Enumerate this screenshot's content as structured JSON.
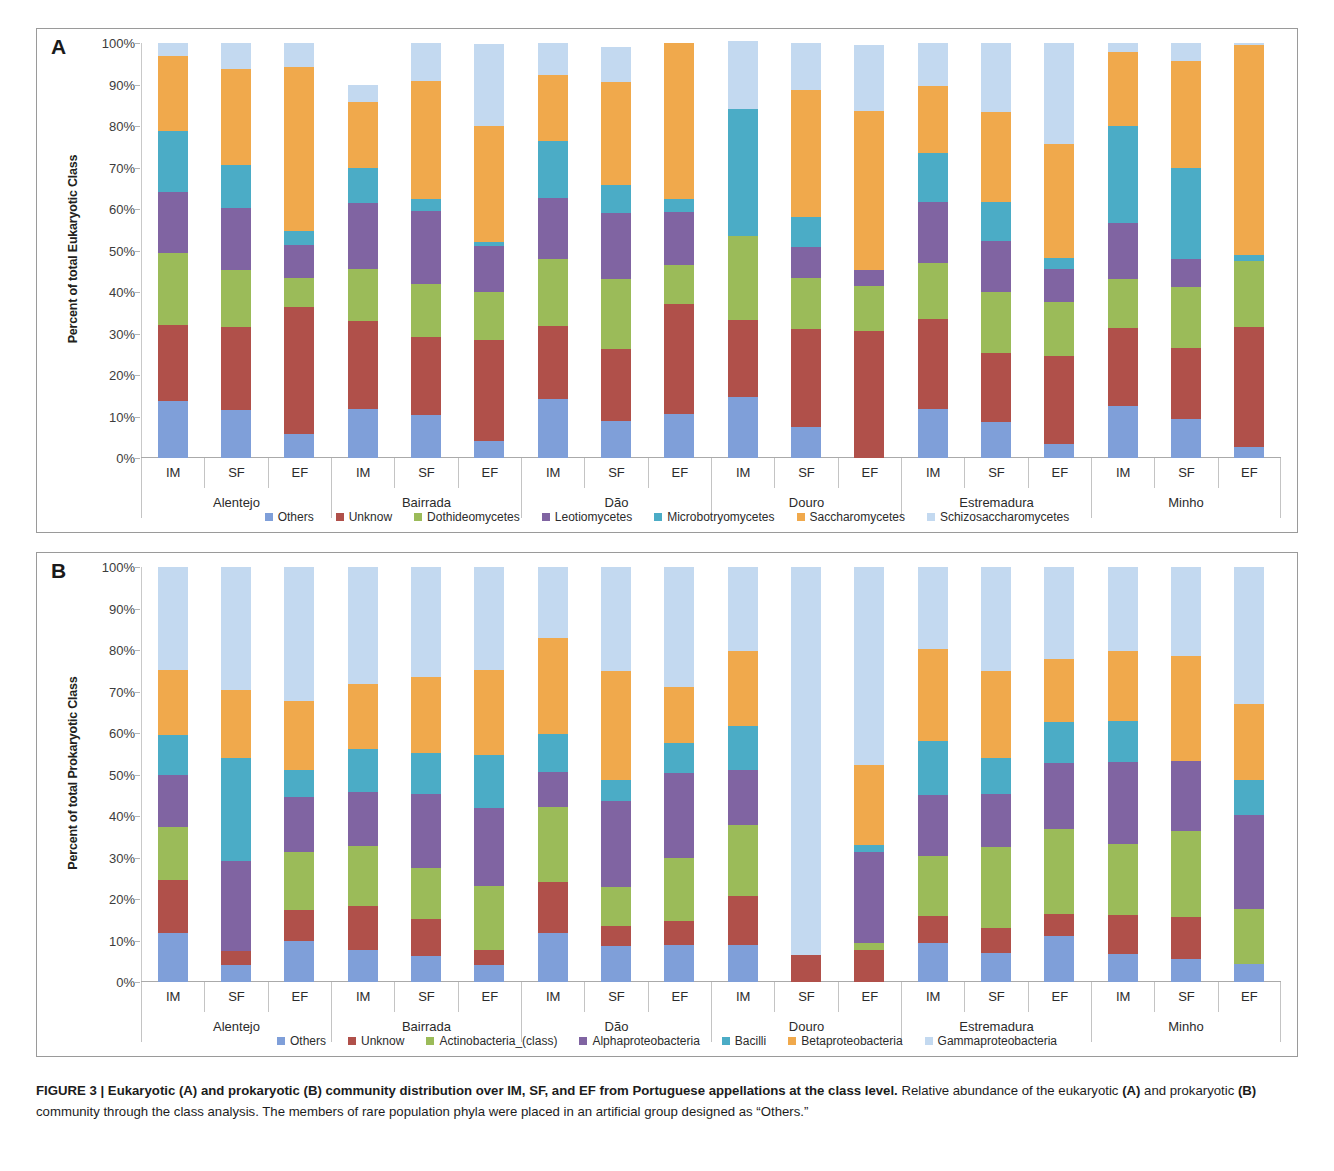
{
  "figure": {
    "caption_bold": "FIGURE 3 | Eukaryotic (A) and prokaryotic (B) community distribution over IM, SF, and EF from Portuguese appellations at the class level.",
    "caption_rest_1": " Relative abundance of the eukaryotic ",
    "caption_b_a": "(A)",
    "caption_rest_2": " and prokaryotic ",
    "caption_b_b": "(B)",
    "caption_rest_3": " community through the class analysis. The members of rare population phyla were placed in an artificial group designed as “Others.”"
  },
  "panel_a": {
    "letter": "A",
    "ylabel": "Percent of total Eukaryotic Class",
    "ytick_labels": [
      "0%",
      "10%",
      "20%",
      "30%",
      "40%",
      "50%",
      "60%",
      "70%",
      "80%",
      "90%",
      "100%"
    ]
  },
  "panel_b": {
    "letter": "B",
    "ylabel": "Percent of total Prokaryotic Class",
    "ytick_labels": [
      "0%",
      "10%",
      "20%",
      "30%",
      "40%",
      "50%",
      "60%",
      "70%",
      "80%",
      "90%",
      "100%"
    ]
  },
  "samples": [
    "IM",
    "SF",
    "EF"
  ],
  "regions": [
    "Alentejo",
    "Bairrada",
    "Dão",
    "Douro",
    "Estremadura",
    "Minho"
  ],
  "colors": {
    "others": "#7f9fd9",
    "unknow": "#b0504a",
    "green": "#9bbb59",
    "purple": "#8064a2",
    "teal": "#4bacc6",
    "orange": "#f0a94c",
    "pale_blue": "#c3d9f0"
  },
  "chart_data": [
    {
      "type": "bar",
      "id": "panel-a",
      "title": "Eukaryotic community distribution at the class level",
      "stacked": true,
      "xlabel": "",
      "ylabel": "Percent of total Eukaryotic Class",
      "ylim": [
        0,
        100
      ],
      "ytick_labels": [
        "0%",
        "10%",
        "20%",
        "30%",
        "40%",
        "50%",
        "60%",
        "70%",
        "80%",
        "90%",
        "100%"
      ],
      "grid": false,
      "legend_position": "bottom",
      "legend": [
        "Others",
        "Unknow",
        "Dothideomycetes",
        "Leotiomycetes",
        "Microbotryomycetes",
        "Saccharomycetes",
        "Schizosaccharomycetes"
      ],
      "categories": [
        "Alentejo IM",
        "Alentejo SF",
        "Alentejo EF",
        "Bairrada IM",
        "Bairrada SF",
        "Bairrada EF",
        "Dão IM",
        "Dão SF",
        "Dão EF",
        "Douro IM",
        "Douro SF",
        "Douro EF",
        "Estremadura IM",
        "Estremadura SF",
        "Estremadura EF",
        "Minho IM",
        "Minho SF",
        "Minho EF"
      ],
      "series": [
        {
          "name": "Others",
          "color": "#7f9fd9",
          "values": [
            13.8,
            11.5,
            5.8,
            11.8,
            10.3,
            4.2,
            14.3,
            8.8,
            10.5,
            14.7,
            7.5,
            0.0,
            11.9,
            8.7,
            3.3,
            12.5,
            9.3,
            2.7
          ]
        },
        {
          "name": "Unknow",
          "color": "#b0504a",
          "values": [
            18.2,
            20.0,
            30.5,
            21.2,
            18.9,
            24.3,
            17.4,
            17.5,
            26.6,
            18.5,
            23.6,
            30.5,
            21.5,
            16.7,
            21.2,
            18.8,
            17.2,
            28.8
          ]
        },
        {
          "name": "Dothideomycetes",
          "color": "#9bbb59",
          "values": [
            17.5,
            13.8,
            7.1,
            12.5,
            12.7,
            11.5,
            16.3,
            16.9,
            9.5,
            20.2,
            12.2,
            10.9,
            13.6,
            14.6,
            13.2,
            11.9,
            14.7,
            16.0
          ]
        },
        {
          "name": "Leotiomycetes",
          "color": "#8064a2",
          "values": [
            14.6,
            15.0,
            8.0,
            15.9,
            17.6,
            11.0,
            14.6,
            15.8,
            12.7,
            0.0,
            7.5,
            3.8,
            14.6,
            12.3,
            7.8,
            13.4,
            6.7,
            0.0
          ]
        },
        {
          "name": "Microbotryomycetes",
          "color": "#4bacc6",
          "values": [
            14.6,
            10.2,
            3.2,
            8.5,
            2.9,
            1.0,
            13.7,
            6.9,
            3.1,
            30.6,
            7.3,
            0.0,
            12.0,
            9.4,
            2.6,
            23.5,
            21.9,
            1.3
          ]
        },
        {
          "name": "Saccharomycetes",
          "color": "#f0a94c",
          "values": [
            18.2,
            23.3,
            39.6,
            15.9,
            28.4,
            28.0,
            15.9,
            24.6,
            37.6,
            0.0,
            30.5,
            38.5,
            16.1,
            21.6,
            27.5,
            17.8,
            25.8,
            50.7
          ]
        },
        {
          "name": "Schizosaccharomycetes",
          "color": "#c3d9f0",
          "values": [
            3.1,
            6.2,
            5.8,
            4.2,
            9.2,
            19.8,
            7.8,
            8.6,
            0.0,
            16.5,
            11.4,
            15.8,
            10.3,
            16.7,
            24.4,
            2.1,
            4.4,
            0.5
          ]
        }
      ]
    },
    {
      "type": "bar",
      "id": "panel-b",
      "title": "Prokaryotic community distribution at the class level",
      "stacked": true,
      "xlabel": "",
      "ylabel": "Percent of total Prokaryotic Class",
      "ylim": [
        0,
        100
      ],
      "ytick_labels": [
        "0%",
        "10%",
        "20%",
        "30%",
        "40%",
        "50%",
        "60%",
        "70%",
        "80%",
        "90%",
        "100%"
      ],
      "grid": false,
      "legend_position": "bottom",
      "legend": [
        "Others",
        "Unknow",
        "Actinobacteria_(class)",
        "Alphaproteobacteria",
        "Bacilli",
        "Betaproteobacteria",
        "Gammaproteobacteria"
      ],
      "categories": [
        "Alentejo IM",
        "Alentejo SF",
        "Alentejo EF",
        "Bairrada IM",
        "Bairrada SF",
        "Bairrada EF",
        "Dão IM",
        "Dão SF",
        "Dão EF",
        "Douro IM",
        "Douro SF",
        "Douro EF",
        "Estremadura IM",
        "Estremadura SF",
        "Estremadura EF",
        "Minho IM",
        "Minho SF",
        "Minho EF"
      ],
      "series": [
        {
          "name": "Others",
          "color": "#7f9fd9",
          "values": [
            11.9,
            4.2,
            9.9,
            7.7,
            6.2,
            4.2,
            11.7,
            8.6,
            8.8,
            9.0,
            0.0,
            0.0,
            9.5,
            7.1,
            11.2,
            6.8,
            5.5,
            4.3
          ]
        },
        {
          "name": "Unknow",
          "color": "#b0504a",
          "values": [
            12.6,
            3.2,
            7.5,
            10.5,
            9.0,
            3.6,
            12.4,
            4.8,
            5.8,
            11.7,
            6.4,
            7.8,
            6.3,
            5.9,
            5.2,
            9.4,
            10.1,
            0.0
          ]
        },
        {
          "name": "Actinobacteria_(class)",
          "color": "#9bbb59",
          "values": [
            12.8,
            0.0,
            13.9,
            14.6,
            12.3,
            15.4,
            18.1,
            9.5,
            15.4,
            17.1,
            0.0,
            1.5,
            14.5,
            19.6,
            20.4,
            17.0,
            20.8,
            13.2
          ]
        },
        {
          "name": "Alphaproteobacteria",
          "color": "#8064a2",
          "values": [
            12.6,
            21.8,
            13.2,
            13.0,
            17.8,
            18.8,
            8.4,
            20.7,
            20.4,
            13.3,
            0.0,
            22.1,
            14.7,
            12.6,
            16.0,
            19.8,
            16.8,
            22.7
          ]
        },
        {
          "name": "Bacilli",
          "color": "#4bacc6",
          "values": [
            9.7,
            24.9,
            6.7,
            10.4,
            9.9,
            12.6,
            9.2,
            5.0,
            7.1,
            10.7,
            0.0,
            1.7,
            13.0,
            8.8,
            9.8,
            9.9,
            0.0,
            8.5
          ]
        },
        {
          "name": "Betaproteobacteria",
          "color": "#f0a94c",
          "values": [
            15.5,
            16.2,
            16.6,
            15.5,
            18.2,
            20.7,
            23.1,
            26.4,
            13.6,
            18.0,
            0.0,
            19.1,
            22.3,
            21.0,
            15.3,
            16.9,
            25.4,
            18.2
          ]
        },
        {
          "name": "Gammaproteobacteria",
          "color": "#c3d9f0",
          "values": [
            24.9,
            29.7,
            32.2,
            28.3,
            26.6,
            24.7,
            17.1,
            25.0,
            28.9,
            20.2,
            93.6,
            47.8,
            19.7,
            25.0,
            22.1,
            20.2,
            21.4,
            33.1
          ]
        }
      ]
    }
  ]
}
